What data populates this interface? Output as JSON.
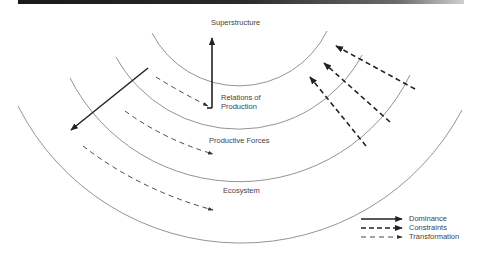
{
  "diagram": {
    "type": "concentric-arc-layers",
    "layers": [
      {
        "id": "superstructure",
        "label": "Superstructure"
      },
      {
        "id": "relations",
        "label_line1": "Relations of",
        "label_line2": "Production"
      },
      {
        "id": "productive-forces",
        "label": "Productive Forces"
      },
      {
        "id": "ecosystem",
        "label": "Ecosystem"
      }
    ],
    "arrows": [
      {
        "type": "Dominance",
        "from": "relations",
        "to": "superstructure"
      },
      {
        "type": "Dominance",
        "from": "relations",
        "to": "ecosystem"
      },
      {
        "type": "Transformation",
        "from": "relations",
        "to": "relations"
      },
      {
        "type": "Transformation",
        "from": "productive-forces",
        "to": "productive-forces"
      },
      {
        "type": "Transformation",
        "from": "ecosystem",
        "to": "ecosystem"
      },
      {
        "type": "Constraints",
        "from": "ecosystem",
        "to": "superstructure"
      },
      {
        "type": "Constraints",
        "from": "ecosystem",
        "to": "relations"
      },
      {
        "type": "Constraints",
        "from": "productive-forces",
        "to": "relations"
      }
    ]
  },
  "labels": {
    "superstructure": "Superstructure",
    "relations_line1": "Relations of",
    "relations_line2": "Production",
    "productive_forces": "Productive Forces",
    "ecosystem": "Ecosystem"
  },
  "legend": {
    "items": [
      {
        "label": "Dominance",
        "style": "solid-thick"
      },
      {
        "label": "Constraints",
        "style": "dashed-thick"
      },
      {
        "label": "Transformation",
        "style": "dashed-thin"
      }
    ]
  },
  "colors": {
    "line": "#333333",
    "arc": "#777777",
    "text": "#444444"
  }
}
